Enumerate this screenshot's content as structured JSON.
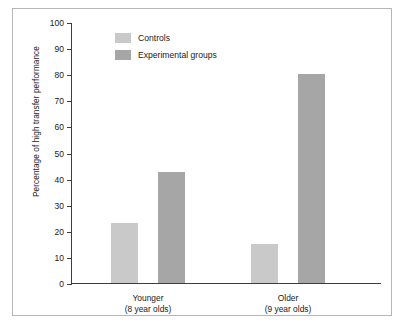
{
  "chart_data": {
    "type": "bar",
    "title": "",
    "xlabel": "",
    "ylabel": "Percentage of high transfer performance",
    "ylim": [
      0,
      100
    ],
    "ytick_step": 10,
    "yticks": [
      100,
      90,
      80,
      70,
      60,
      50,
      40,
      30,
      20,
      10,
      0
    ],
    "grid": false,
    "legend_position": "top-left inside plot",
    "categories": [
      "Younger\n(8 year olds)",
      "Older\n(9 year olds)"
    ],
    "category_lines": [
      [
        "Younger",
        "(8 year olds)"
      ],
      [
        "Older",
        "(9 year olds)"
      ]
    ],
    "series": [
      {
        "name": "Controls",
        "values": [
          23,
          15
        ],
        "color": "#c9c9c9"
      },
      {
        "name": "Experimental groups",
        "values": [
          42.5,
          80
        ],
        "color": "#a6a6a6"
      }
    ]
  },
  "legend": {
    "items": [
      {
        "label": "Controls",
        "color": "#c9c9c9"
      },
      {
        "label": "Experimental groups",
        "color": "#a6a6a6"
      }
    ]
  },
  "axis": {
    "y_title": "Percentage of high transfer performance",
    "tick_labels": [
      "100",
      "90",
      "80",
      "70",
      "60",
      "50",
      "40",
      "30",
      "20",
      "10",
      "0"
    ]
  },
  "colors": {
    "controls": "#c9c9c9",
    "experimental": "#a6a6a6",
    "axis": "#3d3d3d",
    "frame": "#b6b6b6",
    "background": "#ffffff",
    "text": "#1a1a1a"
  }
}
